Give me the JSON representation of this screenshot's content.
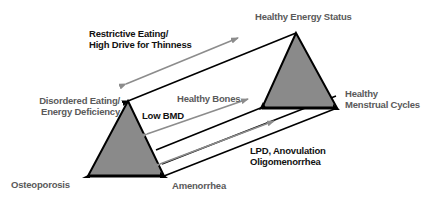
{
  "diagram": {
    "colors": {
      "triangle_fill": "#8a8a8a",
      "triangle_stroke": "#000000",
      "connector_line": "#000000",
      "gray_arrow": "#8c8c8c",
      "dark_text": "#111111",
      "gray_text": "#5a5a5a"
    },
    "labels": {
      "restrictive_eating_line1": "Restrictive Eating/",
      "restrictive_eating_line2": "High Drive for Thinness",
      "healthy_energy_status": "Healthy Energy Status",
      "disordered_eating_line1": "Disordered Eating/",
      "disordered_eating_line2": "Energy Deficiency",
      "healthy_bones": "Healthy Bones",
      "low_bmd": "Low BMD",
      "healthy_menstrual_line1": "Healthy",
      "healthy_menstrual_line2": "Menstrual Cycles",
      "lpd_line1": "LPD, Anovulation",
      "lpd_line2": "Oligomenorrhea",
      "osteoporosis": "Osteoporosis",
      "amenorrhea": "Amenorrhea"
    },
    "left_triangle": {
      "apex": "Disordered Eating/Energy Deficiency",
      "base_left": "Osteoporosis",
      "base_right": "Amenorrhea"
    },
    "right_triangle": {
      "apex": "Healthy Energy Status",
      "base_left": "Healthy Bones",
      "base_right": "Healthy Menstrual Cycles"
    },
    "spectrum_arrows": [
      {
        "label": "Restrictive Eating/High Drive for Thinness",
        "from": "Healthy Energy Status",
        "to": "Disordered Eating/Energy Deficiency"
      },
      {
        "label": "Low BMD",
        "from": "Healthy Bones",
        "to": "Osteoporosis"
      },
      {
        "label": "LPD, Anovulation Oligomenorrhea",
        "from": "Healthy Menstrual Cycles",
        "to": "Amenorrhea"
      }
    ]
  }
}
